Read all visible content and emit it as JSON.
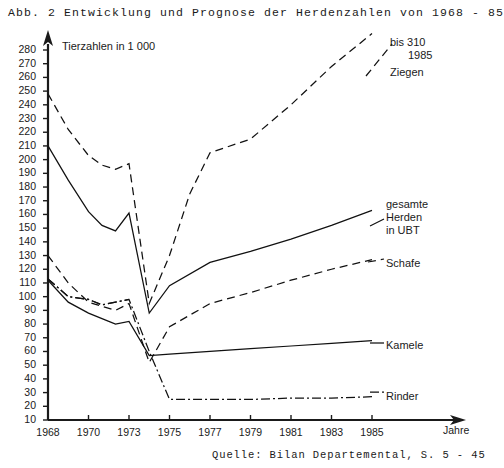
{
  "figure": {
    "number_label": "Abb. 2",
    "title": "Abb. 2  Entwicklung und Prognose der Herdenzahlen von 1968 - 85",
    "subtitle": "Tierzahlen in 1 000",
    "source": "Quelle: Bilan Departemental, S. 5 - 45",
    "x_axis_unit": "Jahre"
  },
  "annotations": {
    "ziegen_note_line1": "bis 310",
    "ziegen_note_line2": "1985",
    "ziegen_label": "Ziegen",
    "gesamte_line1": "gesamte",
    "gesamte_line2": "Herden",
    "gesamte_line3": "in UBT",
    "schafe_label": "Schafe",
    "kamele_label": "Kamele",
    "rinder_label": "Rinder"
  },
  "chart_data": {
    "type": "line",
    "title": "Entwicklung und Prognose der Herdenzahlen von 1968 - 85",
    "subtitle": "Tierzahlen in 1 000",
    "xlabel": "Jahre",
    "ylabel": "Tierzahlen in 1 000",
    "xlim": [
      1968,
      1985
    ],
    "ylim": [
      10,
      280
    ],
    "ytick_step": 10,
    "yticks": [
      280,
      270,
      260,
      250,
      240,
      230,
      220,
      210,
      200,
      190,
      180,
      170,
      160,
      150,
      140,
      130,
      120,
      110,
      100,
      90,
      80,
      70,
      60,
      50,
      40,
      30,
      20,
      10
    ],
    "xticks": [
      1968,
      1970,
      1973,
      1975,
      1977,
      1979,
      1981,
      1983,
      1985
    ],
    "xtick_labels": [
      "1968",
      "1970",
      "1973",
      "1975",
      "1977",
      "1979",
      "1981",
      "1983",
      "1985"
    ],
    "grid": false,
    "legend_position": "right-inline-labels",
    "series": [
      {
        "name": "Ziegen",
        "style": "dashed",
        "annotation": "bis 310 1985",
        "x": [
          1968,
          1969,
          1970,
          1971,
          1972,
          1973,
          1974,
          1975,
          1976,
          1977,
          1979,
          1981,
          1983,
          1985
        ],
        "y": [
          248,
          222,
          203,
          196,
          193,
          197,
          95,
          130,
          175,
          205,
          215,
          240,
          268,
          292
        ]
      },
      {
        "name": "gesamte Herden in UBT",
        "style": "solid",
        "x": [
          1968,
          1969,
          1970,
          1971,
          1972,
          1973,
          1974,
          1975,
          1977,
          1979,
          1981,
          1983,
          1985
        ],
        "y": [
          210,
          185,
          162,
          152,
          148,
          161,
          88,
          108,
          125,
          133,
          142,
          152,
          163
        ]
      },
      {
        "name": "Schafe",
        "style": "dashed",
        "x": [
          1968,
          1969,
          1970,
          1971,
          1972,
          1973,
          1974,
          1975,
          1977,
          1979,
          1981,
          1983,
          1985
        ],
        "y": [
          130,
          110,
          96,
          93,
          90,
          95,
          52,
          78,
          95,
          103,
          112,
          120,
          127
        ]
      },
      {
        "name": "Kamele",
        "style": "solid",
        "x": [
          1968,
          1969,
          1970,
          1971,
          1972,
          1973,
          1974,
          1975,
          1977,
          1979,
          1981,
          1983,
          1985
        ],
        "y": [
          112,
          96,
          88,
          84,
          80,
          82,
          57,
          58,
          60,
          62,
          64,
          66,
          68
        ]
      },
      {
        "name": "Rinder",
        "style": "dash-dot",
        "x": [
          1968,
          1969,
          1970,
          1971,
          1972,
          1973,
          1974,
          1975,
          1977,
          1979,
          1981,
          1983,
          1985
        ],
        "y": [
          113,
          100,
          98,
          94,
          96,
          98,
          60,
          25,
          25,
          25,
          26,
          26,
          27
        ]
      },
      {
        "name": "Rinder-upper-branch",
        "style": "dash-dot",
        "x": [
          1968,
          1969,
          1970,
          1971,
          1972,
          1973
        ],
        "y": [
          113,
          100,
          98,
          94,
          96,
          98
        ]
      }
    ]
  }
}
